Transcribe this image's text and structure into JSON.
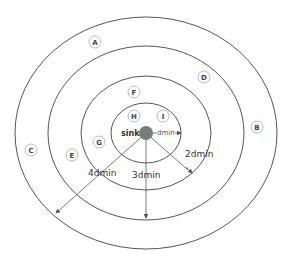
{
  "diagram": {
    "center": {
      "x": 146,
      "y": 133
    },
    "sink": {
      "label": "sink",
      "color": "#7a7a7a"
    },
    "rings": [
      {
        "name": "ring-1",
        "rx": 35,
        "ry": 30
      },
      {
        "name": "ring-2",
        "rx": 65,
        "ry": 57
      },
      {
        "name": "ring-3",
        "rx": 98,
        "ry": 87
      },
      {
        "name": "ring-4",
        "rx": 131,
        "ry": 116
      }
    ],
    "nodes": [
      {
        "label": "A",
        "x": 95,
        "y": 42
      },
      {
        "label": "B",
        "x": 257,
        "y": 127
      },
      {
        "label": "C",
        "x": 31,
        "y": 150
      },
      {
        "label": "D",
        "x": 204,
        "y": 77
      },
      {
        "label": "E",
        "x": 72,
        "y": 155
      },
      {
        "label": "F",
        "x": 134,
        "y": 92
      },
      {
        "label": "G",
        "x": 99,
        "y": 142
      },
      {
        "label": "H",
        "x": 134,
        "y": 116
      },
      {
        "label": "I",
        "x": 163,
        "y": 116
      }
    ],
    "distances": {
      "dmin": "dmin",
      "d2": "2dmin",
      "d3": "3dmin",
      "d4": "4dmin"
    },
    "line_color": "#555555"
  }
}
